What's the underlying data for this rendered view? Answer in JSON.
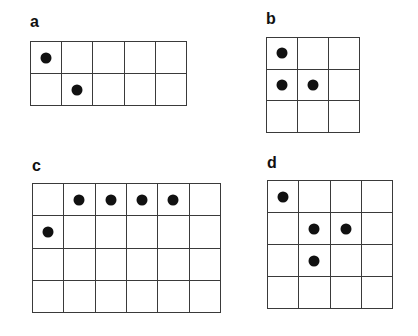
{
  "figure": {
    "panels": [
      {
        "id": "a",
        "label": "a",
        "label_pos": {
          "x": 30,
          "y": 14
        },
        "grid_pos": {
          "x": 30,
          "y": 41,
          "w": 157,
          "h": 65
        },
        "cols": 5,
        "rows": 2,
        "dots": [
          [
            0,
            0
          ],
          [
            1,
            1
          ]
        ]
      },
      {
        "id": "b",
        "label": "b",
        "label_pos": {
          "x": 266,
          "y": 11
        },
        "grid_pos": {
          "x": 266,
          "y": 37,
          "w": 94,
          "h": 96
        },
        "cols": 3,
        "rows": 3,
        "dots": [
          [
            0,
            0
          ],
          [
            1,
            0
          ],
          [
            1,
            1
          ]
        ]
      },
      {
        "id": "c",
        "label": "c",
        "label_pos": {
          "x": 32,
          "y": 158
        },
        "grid_pos": {
          "x": 32,
          "y": 183,
          "w": 189,
          "h": 130
        },
        "cols": 6,
        "rows": 4,
        "dots": [
          [
            0,
            1
          ],
          [
            0,
            2
          ],
          [
            0,
            3
          ],
          [
            0,
            4
          ],
          [
            1,
            0
          ]
        ]
      },
      {
        "id": "d",
        "label": "d",
        "label_pos": {
          "x": 267,
          "y": 155
        },
        "grid_pos": {
          "x": 267,
          "y": 180,
          "w": 126,
          "h": 129
        },
        "cols": 4,
        "rows": 4,
        "dots": [
          [
            0,
            0
          ],
          [
            1,
            1
          ],
          [
            1,
            2
          ],
          [
            2,
            1
          ]
        ]
      }
    ],
    "colors": {
      "grid_line": "#3a3a3a",
      "dot": "#111111",
      "label": "#111111",
      "background": "#ffffff"
    }
  }
}
